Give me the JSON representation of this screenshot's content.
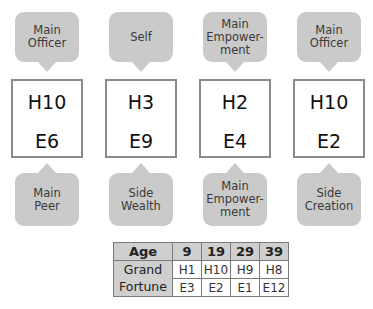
{
  "columns": [
    {
      "top_bubble": [
        "Main",
        "Officer"
      ],
      "heavenly": "H10",
      "earthly": "E6",
      "bottom_bubble": [
        "Main",
        "Peer"
      ]
    },
    {
      "top_bubble": [
        "Self"
      ],
      "heavenly": "H3",
      "earthly": "E9",
      "bottom_bubble": [
        "Side",
        "Wealth"
      ]
    },
    {
      "top_bubble": [
        "Main",
        "Empower-",
        "ment"
      ],
      "heavenly": "H2",
      "earthly": "E4",
      "bottom_bubble": [
        "Main",
        "Empower-",
        "ment"
      ]
    },
    {
      "top_bubble": [
        "Main",
        "Officer"
      ],
      "heavenly": "H10",
      "earthly": "E2",
      "bottom_bubble": [
        "Side",
        "Creation"
      ]
    }
  ],
  "table": {
    "header_label": "Age",
    "row_label_line1": "Grand",
    "row_label_line2": "Fortune",
    "ages": [
      "9",
      "19",
      "29",
      "39"
    ],
    "heavenly": [
      "H1",
      "H10",
      "H9",
      "H8"
    ],
    "earthly": [
      "E3",
      "E2",
      "E1",
      "E12"
    ]
  },
  "colors": {
    "bubble_fill": "#cacaca",
    "box_border": "#8a8a8a",
    "table_header_fill": "#cfcfcf"
  }
}
